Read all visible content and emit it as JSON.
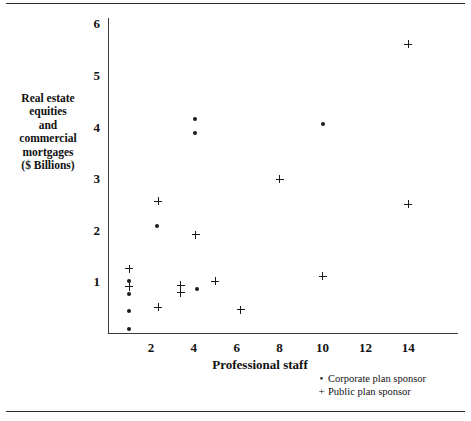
{
  "chart_data": {
    "type": "scatter",
    "title": "",
    "xlabel": "Professional staff",
    "ylabel": "Real estate equities and commercial mortgages ($ Billions)",
    "ylabel_lines": [
      "Real estate",
      "equities",
      "and",
      "commercial",
      "mortgages",
      "($ Billions)"
    ],
    "xlim": [
      0,
      16
    ],
    "ylim": [
      0,
      6.3
    ],
    "xticks": [
      2,
      4,
      6,
      8,
      10,
      12,
      14
    ],
    "yticks": [
      1,
      2,
      3,
      4,
      5,
      6
    ],
    "grid": false,
    "legend_position": "bottom-right",
    "series": [
      {
        "name": "Corporate plan sponsor",
        "marker": "dot",
        "points": [
          {
            "x": 1.0,
            "y": 1.0
          },
          {
            "x": 1.0,
            "y": 0.75
          },
          {
            "x": 1.0,
            "y": 0.42
          },
          {
            "x": 1.0,
            "y": 0.08
          },
          {
            "x": 2.3,
            "y": 2.08
          },
          {
            "x": 4.05,
            "y": 4.15
          },
          {
            "x": 4.05,
            "y": 3.87
          },
          {
            "x": 4.15,
            "y": 0.85
          },
          {
            "x": 10.0,
            "y": 4.05
          }
        ]
      },
      {
        "name": "Public plan sponsor",
        "marker": "plus",
        "points": [
          {
            "x": 1.0,
            "y": 1.25
          },
          {
            "x": 1.0,
            "y": 0.9
          },
          {
            "x": 2.35,
            "y": 2.55
          },
          {
            "x": 2.35,
            "y": 0.5
          },
          {
            "x": 3.4,
            "y": 0.93
          },
          {
            "x": 3.4,
            "y": 0.78
          },
          {
            "x": 4.1,
            "y": 1.9
          },
          {
            "x": 5.0,
            "y": 1.0
          },
          {
            "x": 6.2,
            "y": 0.45
          },
          {
            "x": 8.0,
            "y": 2.98
          },
          {
            "x": 10.0,
            "y": 1.1
          },
          {
            "x": 14.0,
            "y": 2.5
          },
          {
            "x": 14.0,
            "y": 5.6
          }
        ]
      }
    ]
  },
  "legend": {
    "items": [
      {
        "key": "•",
        "label": "Corporate plan sponsor"
      },
      {
        "key": "+",
        "label": "Public plan sponsor"
      }
    ]
  }
}
